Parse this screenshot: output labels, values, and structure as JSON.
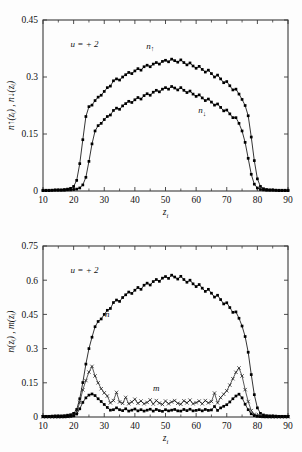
{
  "figure": {
    "background": "#fdfdfd",
    "foreground": "#111111"
  },
  "chart_data": [
    {
      "id": "top",
      "type": "line",
      "title": "",
      "xlabel": "z_i",
      "ylabel": "n↑(zᵢ) , n↓(zᵢ)",
      "xlabel_display": "z",
      "xlabel_sub": "i",
      "annotation": "u = + 2",
      "xlim": [
        10,
        90
      ],
      "ylim": [
        0,
        0.45
      ],
      "xticks": [
        10,
        20,
        30,
        40,
        50,
        60,
        70,
        80,
        90
      ],
      "yticks": [
        0,
        0.15,
        0.3,
        0.45
      ],
      "ytick_labels": [
        "0",
        "0.15",
        "0.3",
        "0.45"
      ],
      "xtick_labels": [
        "10",
        "20",
        "30",
        "40",
        "50",
        "60",
        "70",
        "80",
        "90"
      ],
      "grid": false,
      "legend_position": "inline-annotations",
      "series": [
        {
          "name": "n↑",
          "label": "n",
          "label_arrow": "↑",
          "marker": "square",
          "label_x": 45,
          "label_y": 0.375,
          "x": [
            10,
            11,
            12,
            13,
            14,
            15,
            16,
            17,
            18,
            19,
            20,
            21,
            22,
            23,
            24,
            25,
            26,
            27,
            28,
            29,
            30,
            31,
            32,
            33,
            34,
            35,
            36,
            37,
            38,
            39,
            40,
            41,
            42,
            43,
            44,
            45,
            46,
            47,
            48,
            49,
            50,
            51,
            52,
            53,
            54,
            55,
            56,
            57,
            58,
            59,
            60,
            61,
            62,
            63,
            64,
            65,
            66,
            67,
            68,
            69,
            70,
            71,
            72,
            73,
            74,
            75,
            76,
            77,
            78,
            79,
            80,
            81,
            82,
            83,
            84,
            85,
            86,
            87,
            88,
            89,
            90
          ],
          "y": [
            0.002,
            0.002,
            0.002,
            0.002,
            0.003,
            0.003,
            0.003,
            0.004,
            0.005,
            0.007,
            0.012,
            0.028,
            0.072,
            0.135,
            0.196,
            0.222,
            0.226,
            0.238,
            0.247,
            0.252,
            0.262,
            0.272,
            0.276,
            0.29,
            0.295,
            0.292,
            0.3,
            0.306,
            0.312,
            0.309,
            0.316,
            0.322,
            0.318,
            0.327,
            0.331,
            0.327,
            0.334,
            0.338,
            0.334,
            0.341,
            0.344,
            0.34,
            0.347,
            0.343,
            0.339,
            0.345,
            0.338,
            0.332,
            0.337,
            0.329,
            0.323,
            0.328,
            0.32,
            0.313,
            0.318,
            0.309,
            0.3,
            0.305,
            0.295,
            0.285,
            0.288,
            0.277,
            0.266,
            0.268,
            0.255,
            0.241,
            0.225,
            0.198,
            0.142,
            0.08,
            0.032,
            0.012,
            0.006,
            0.004,
            0.003,
            0.003,
            0.002,
            0.002,
            0.002,
            0.002,
            0.002
          ]
        },
        {
          "name": "n↓",
          "label": "n",
          "label_arrow": "↓",
          "marker": "square",
          "label_x": 62,
          "label_y": 0.205,
          "x": [
            10,
            11,
            12,
            13,
            14,
            15,
            16,
            17,
            18,
            19,
            20,
            21,
            22,
            23,
            24,
            25,
            26,
            27,
            28,
            29,
            30,
            31,
            32,
            33,
            34,
            35,
            36,
            37,
            38,
            39,
            40,
            41,
            42,
            43,
            44,
            45,
            46,
            47,
            48,
            49,
            50,
            51,
            52,
            53,
            54,
            55,
            56,
            57,
            58,
            59,
            60,
            61,
            62,
            63,
            64,
            65,
            66,
            67,
            68,
            69,
            70,
            71,
            72,
            73,
            74,
            75,
            76,
            77,
            78,
            79,
            80,
            81,
            82,
            83,
            84,
            85,
            86,
            87,
            88,
            89,
            90
          ],
          "y": [
            0.001,
            0.001,
            0.001,
            0.002,
            0.002,
            0.002,
            0.002,
            0.002,
            0.003,
            0.003,
            0.004,
            0.005,
            0.008,
            0.016,
            0.036,
            0.078,
            0.124,
            0.158,
            0.172,
            0.178,
            0.188,
            0.196,
            0.2,
            0.212,
            0.218,
            0.215,
            0.224,
            0.23,
            0.236,
            0.233,
            0.24,
            0.246,
            0.242,
            0.251,
            0.256,
            0.252,
            0.26,
            0.265,
            0.261,
            0.268,
            0.272,
            0.268,
            0.275,
            0.271,
            0.266,
            0.272,
            0.265,
            0.259,
            0.263,
            0.255,
            0.249,
            0.253,
            0.245,
            0.238,
            0.242,
            0.234,
            0.226,
            0.229,
            0.22,
            0.211,
            0.213,
            0.203,
            0.193,
            0.193,
            0.178,
            0.158,
            0.128,
            0.086,
            0.044,
            0.018,
            0.008,
            0.004,
            0.003,
            0.002,
            0.002,
            0.002,
            0.002,
            0.001,
            0.001,
            0.001,
            0.001
          ]
        }
      ]
    },
    {
      "id": "bottom",
      "type": "line",
      "title": "",
      "xlabel": "z_i",
      "ylabel": "n(zᵢ) , m(zᵢ)",
      "xlabel_display": "z",
      "xlabel_sub": "i",
      "annotation": "u = + 2",
      "xlim": [
        10,
        90
      ],
      "ylim": [
        0,
        0.75
      ],
      "xticks": [
        10,
        20,
        30,
        40,
        50,
        60,
        70,
        80,
        90
      ],
      "yticks": [
        0,
        0.15,
        0.3,
        0.45,
        0.6,
        0.75
      ],
      "ytick_labels": [
        "0",
        "0.15",
        "0.3",
        "0.45",
        "0.6",
        "0.75"
      ],
      "xtick_labels": [
        "10",
        "20",
        "30",
        "40",
        "50",
        "60",
        "70",
        "80",
        "90"
      ],
      "grid": false,
      "legend_position": "inline-annotations",
      "series": [
        {
          "name": "n",
          "label": "n",
          "label_arrow": "",
          "marker": "square",
          "label_x": 31,
          "label_y": 0.44,
          "x": [
            10,
            11,
            12,
            13,
            14,
            15,
            16,
            17,
            18,
            19,
            20,
            21,
            22,
            23,
            24,
            25,
            26,
            27,
            28,
            29,
            30,
            31,
            32,
            33,
            34,
            35,
            36,
            37,
            38,
            39,
            40,
            41,
            42,
            43,
            44,
            45,
            46,
            47,
            48,
            49,
            50,
            51,
            52,
            53,
            54,
            55,
            56,
            57,
            58,
            59,
            60,
            61,
            62,
            63,
            64,
            65,
            66,
            67,
            68,
            69,
            70,
            71,
            72,
            73,
            74,
            75,
            76,
            77,
            78,
            79,
            80,
            81,
            82,
            83,
            84,
            85,
            86,
            87,
            88,
            89,
            90
          ],
          "y": [
            0.003,
            0.003,
            0.003,
            0.004,
            0.005,
            0.005,
            0.005,
            0.006,
            0.008,
            0.01,
            0.016,
            0.033,
            0.08,
            0.151,
            0.232,
            0.3,
            0.35,
            0.396,
            0.419,
            0.43,
            0.45,
            0.468,
            0.476,
            0.502,
            0.513,
            0.507,
            0.524,
            0.536,
            0.548,
            0.542,
            0.556,
            0.568,
            0.56,
            0.578,
            0.587,
            0.579,
            0.594,
            0.603,
            0.595,
            0.609,
            0.616,
            0.608,
            0.622,
            0.614,
            0.605,
            0.617,
            0.603,
            0.591,
            0.6,
            0.584,
            0.572,
            0.581,
            0.565,
            0.551,
            0.56,
            0.543,
            0.526,
            0.534,
            0.515,
            0.496,
            0.501,
            0.48,
            0.459,
            0.461,
            0.433,
            0.399,
            0.353,
            0.284,
            0.186,
            0.098,
            0.04,
            0.016,
            0.009,
            0.006,
            0.005,
            0.005,
            0.004,
            0.003,
            0.003,
            0.003,
            0.003
          ]
        },
        {
          "name": "m",
          "label": "m",
          "label_arrow": "",
          "marker": "x",
          "label_x": 47,
          "label_y": 0.115,
          "x": [
            10,
            11,
            12,
            13,
            14,
            15,
            16,
            17,
            18,
            19,
            20,
            21,
            22,
            23,
            24,
            25,
            26,
            27,
            28,
            29,
            30,
            31,
            32,
            33,
            34,
            35,
            36,
            37,
            38,
            39,
            40,
            41,
            42,
            43,
            44,
            45,
            46,
            47,
            48,
            49,
            50,
            51,
            52,
            53,
            54,
            55,
            56,
            57,
            58,
            59,
            60,
            61,
            62,
            63,
            64,
            65,
            66,
            67,
            68,
            69,
            70,
            71,
            72,
            73,
            74,
            75,
            76,
            77,
            78,
            79,
            80,
            81,
            82,
            83,
            84,
            85,
            86,
            87,
            88,
            89,
            90
          ],
          "y": [
            0.001,
            0.001,
            0.001,
            0.001,
            0.001,
            0.001,
            0.001,
            0.002,
            0.002,
            0.004,
            0.008,
            0.023,
            0.064,
            0.119,
            0.16,
            0.197,
            0.222,
            0.18,
            0.15,
            0.124,
            0.106,
            0.092,
            0.062,
            0.072,
            0.108,
            0.066,
            0.06,
            0.086,
            0.058,
            0.066,
            0.078,
            0.06,
            0.07,
            0.058,
            0.064,
            0.075,
            0.057,
            0.072,
            0.061,
            0.055,
            0.07,
            0.058,
            0.066,
            0.072,
            0.06,
            0.056,
            0.071,
            0.062,
            0.074,
            0.058,
            0.063,
            0.07,
            0.058,
            0.072,
            0.062,
            0.068,
            0.105,
            0.062,
            0.085,
            0.1,
            0.115,
            0.14,
            0.168,
            0.196,
            0.215,
            0.18,
            0.12,
            0.068,
            0.028,
            0.012,
            0.005,
            0.003,
            0.002,
            0.002,
            0.001,
            0.001,
            0.001,
            0.001,
            0.001,
            0.001,
            0.001
          ]
        },
        {
          "name": "m-lower",
          "label": "",
          "label_arrow": "",
          "marker": "square",
          "label_x": null,
          "label_y": null,
          "x": [
            10,
            11,
            12,
            13,
            14,
            15,
            16,
            17,
            18,
            19,
            20,
            21,
            22,
            23,
            24,
            25,
            26,
            27,
            28,
            29,
            30,
            31,
            32,
            33,
            34,
            35,
            36,
            37,
            38,
            39,
            40,
            41,
            42,
            43,
            44,
            45,
            46,
            47,
            48,
            49,
            50,
            51,
            52,
            53,
            54,
            55,
            56,
            57,
            58,
            59,
            60,
            61,
            62,
            63,
            64,
            65,
            66,
            67,
            68,
            69,
            70,
            71,
            72,
            73,
            74,
            75,
            76,
            77,
            78,
            79,
            80,
            81,
            82,
            83,
            84,
            85,
            86,
            87,
            88,
            89,
            90
          ],
          "y": [
            0.001,
            0.001,
            0.001,
            0.001,
            0.001,
            0.001,
            0.001,
            0.001,
            0.002,
            0.003,
            0.005,
            0.013,
            0.036,
            0.064,
            0.084,
            0.096,
            0.101,
            0.094,
            0.08,
            0.068,
            0.055,
            0.042,
            0.03,
            0.032,
            0.04,
            0.032,
            0.028,
            0.036,
            0.026,
            0.03,
            0.035,
            0.027,
            0.032,
            0.026,
            0.03,
            0.034,
            0.026,
            0.033,
            0.028,
            0.025,
            0.032,
            0.027,
            0.03,
            0.033,
            0.027,
            0.026,
            0.033,
            0.028,
            0.034,
            0.027,
            0.029,
            0.032,
            0.027,
            0.033,
            0.029,
            0.031,
            0.046,
            0.029,
            0.04,
            0.047,
            0.054,
            0.066,
            0.08,
            0.092,
            0.1,
            0.084,
            0.056,
            0.032,
            0.014,
            0.006,
            0.003,
            0.002,
            0.001,
            0.001,
            0.001,
            0.001,
            0.001,
            0.001,
            0.001,
            0.001,
            0.001
          ]
        }
      ]
    }
  ]
}
